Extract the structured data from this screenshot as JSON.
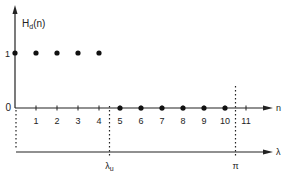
{
  "chart_data": {
    "type": "scatter",
    "title": "",
    "ylabel": "H",
    "ylabel_sub": "d",
    "ylabel_suffix": "(n)",
    "xlabel": "n",
    "lambda_axis_label": "λ",
    "y_tick_labels": [
      "1",
      "0"
    ],
    "x_tick_labels": [
      "1",
      "2",
      "3",
      "4",
      "5",
      "6",
      "7",
      "8",
      "9",
      "10",
      "11"
    ],
    "x": [
      0,
      1,
      2,
      3,
      4,
      5,
      6,
      7,
      8,
      9,
      10
    ],
    "values": [
      1,
      1,
      1,
      1,
      1,
      0,
      0,
      0,
      0,
      0,
      0
    ],
    "xlim": [
      0,
      12
    ],
    "ylim": [
      0,
      1
    ],
    "lambda_markers": [
      {
        "label": "λ",
        "sub": "u",
        "at_n": 4.5
      },
      {
        "label": "π",
        "sub": "",
        "at_n": 10.5
      }
    ]
  }
}
